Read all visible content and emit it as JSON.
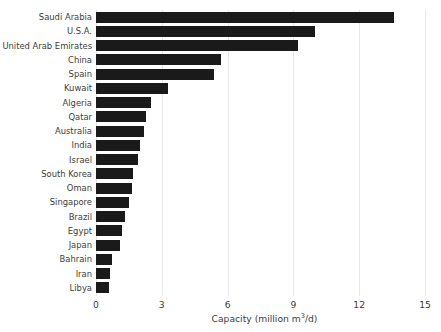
{
  "chart_data": {
    "type": "bar",
    "orientation": "horizontal",
    "title": "",
    "xlabel": "Capacity (million m³/d)",
    "ylabel": "",
    "xlim": [
      0,
      15
    ],
    "xticks": [
      0,
      3,
      6,
      9,
      12,
      15
    ],
    "xtick_labels": [
      "0",
      "3",
      "6",
      "9",
      "12",
      "15"
    ],
    "grid": "vertical",
    "legend": "none",
    "bar_color": "#1a1a1a",
    "grid_color": "#e9e9e9",
    "text_color": "#3c3c3c",
    "categories": [
      "Saudi Arabia",
      "U.S.A.",
      "United Arab Emirates",
      "China",
      "Spain",
      "Kuwait",
      "Algeria",
      "Qatar",
      "Australia",
      "India",
      "Israel",
      "South Korea",
      "Oman",
      "Singapore",
      "Brazil",
      "Egypt",
      "Japan",
      "Bahrain",
      "Iran",
      "Libya"
    ],
    "values": [
      13.6,
      10.0,
      9.2,
      5.7,
      5.4,
      3.3,
      2.5,
      2.3,
      2.2,
      2.0,
      1.9,
      1.7,
      1.65,
      1.5,
      1.3,
      1.2,
      1.1,
      0.75,
      0.65,
      0.6
    ]
  }
}
